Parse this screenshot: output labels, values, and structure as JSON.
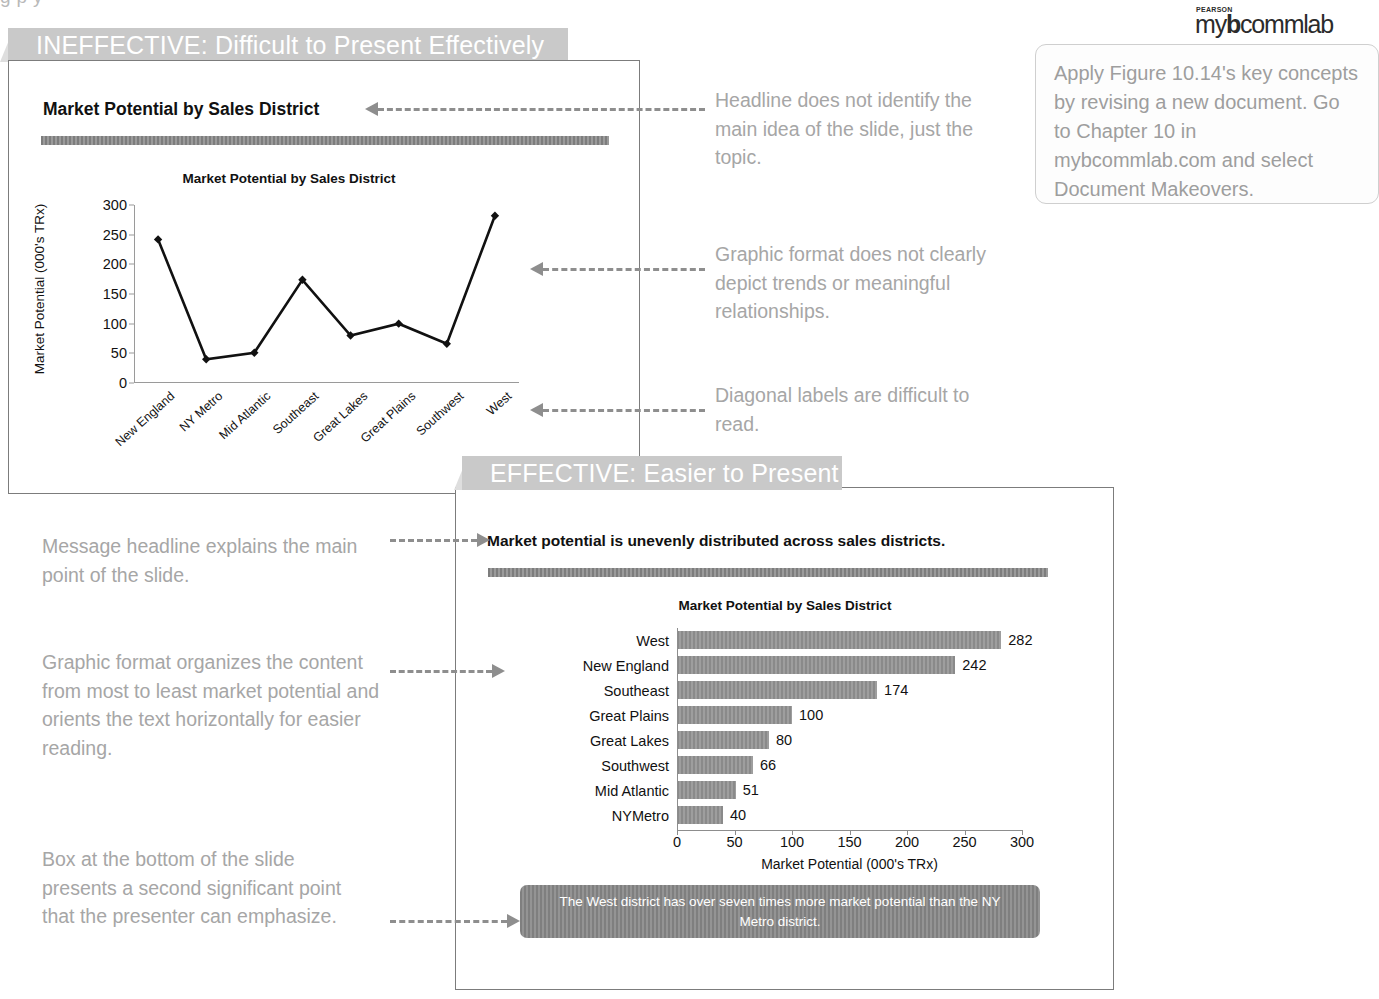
{
  "top_fragment": "g           p                y",
  "sections": {
    "ineffective": {
      "banner_label": "INEFFECTIVE: Difficult to Present Effectively",
      "slide_headline": "Market Potential by Sales District"
    },
    "effective": {
      "banner_label": "EFFECTIVE: Easier to Present",
      "slide_headline": "Market potential is unevenly distributed across sales districts.",
      "callout_text": "The West district has over seven times more market potential than the NY Metro district."
    }
  },
  "annotations": {
    "headline_note": "Headline does not identify the main idea of the slide, just the topic.",
    "graphic_note": "Graphic format does not clearly depict trends or meaningful relationships.",
    "diagonal_note": "Diagonal labels are difficult to read.",
    "message_note": "Message headline explains the main point of the slide.",
    "organize_note": "Graphic format organizes the content from most to least market potential and orients the text horizontally for easier reading.",
    "box_note": "Box at the bottom of the slide presents a second significant point that the presenter can emphasize."
  },
  "mybcommlab": {
    "brand_pearson": "PEARSON",
    "brand_my": "my",
    "brand_b": "b",
    "brand_commlab": "commlab",
    "body": "Apply Figure 10.14's key concepts by revising a new document. Go to Chapter 10 in mybcommlab.com and select Document Makeovers."
  },
  "colors": {
    "banner_bg": "#c9c9c9",
    "banner_fold": "#dedede",
    "annotation_text": "#a6a6a6",
    "arrow": "#8e8e8e",
    "bar_fill": "#8a8a8a",
    "callout_bg": "#7f7f7f",
    "slide_border": "#7c7c7c",
    "rule": "#7d7d7d"
  },
  "chart_data": [
    {
      "type": "line",
      "title": "Market Potential by Sales District",
      "xlabel": "",
      "ylabel": "Market Potential (000's TRx)",
      "categories": [
        "New England",
        "NY Metro",
        "Mid Atlantic",
        "Southeast",
        "Great Lakes",
        "Great Plains",
        "Southwest",
        "West"
      ],
      "values": [
        242,
        40,
        51,
        174,
        80,
        100,
        66,
        282
      ],
      "ylim": [
        0,
        300
      ],
      "yticks": [
        0,
        50,
        100,
        150,
        200,
        250,
        300
      ],
      "grid": false,
      "legend": "none",
      "marker": "diamond",
      "tick_label_rotation": -42
    },
    {
      "type": "bar",
      "orientation": "horizontal",
      "title": "Market Potential by Sales District",
      "xlabel": "Market Potential (000's TRx)",
      "ylabel": "",
      "categories": [
        "West",
        "New England",
        "Southeast",
        "Great Plains",
        "Great Lakes",
        "Southwest",
        "Mid Atlantic",
        "NYMetro"
      ],
      "values": [
        282,
        242,
        174,
        100,
        80,
        66,
        51,
        40
      ],
      "xlim": [
        0,
        300
      ],
      "xticks": [
        0,
        50,
        100,
        150,
        200,
        250,
        300
      ],
      "grid": false,
      "legend": "none",
      "data_labels": true
    }
  ]
}
